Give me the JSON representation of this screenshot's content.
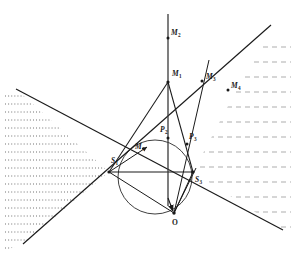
{
  "figure": {
    "width": 293,
    "height": 259,
    "background_color": "#ffffff",
    "stroke_color": "#1a1a1a",
    "hatch_color_left": "#3a3a3a",
    "hatch_color_right": "#7a7a7a"
  },
  "labels": {
    "m2": {
      "text": "M",
      "sub": "2",
      "x": 171,
      "y": 33
    },
    "m1": {
      "text": "M",
      "sub": "1",
      "x": 172,
      "y": 74
    },
    "m3": {
      "text": "M",
      "sub": "3",
      "x": 205,
      "y": 78
    },
    "m4_right": {
      "text": "M",
      "sub": "4",
      "x": 232,
      "y": 86
    },
    "m4_inner": {
      "text": "M",
      "sub": "4",
      "x": 136,
      "y": 148
    },
    "p2": {
      "text": "P",
      "sub": "2",
      "x": 160,
      "y": 130
    },
    "p3": {
      "text": "P",
      "sub": "3",
      "x": 189,
      "y": 138
    },
    "s1": {
      "text": "S",
      "sub": "1",
      "x": 112,
      "y": 152
    },
    "s3": {
      "text": "S",
      "sub": "3",
      "x": 196,
      "y": 174
    },
    "o": {
      "text": "O",
      "sub": "",
      "x": 174,
      "y": 220
    }
  },
  "geometry": {
    "circle": {
      "cx": 155,
      "cy": 177,
      "r": 37
    },
    "point_o": {
      "x": 174,
      "y": 213
    },
    "point_s1": {
      "x": 109,
      "y": 172
    },
    "point_s3": {
      "x": 193,
      "y": 172
    },
    "point_m1": {
      "x": 168,
      "y": 82
    },
    "point_p2": {
      "x": 168,
      "y": 137
    },
    "point_p3": {
      "x": 186,
      "y": 143
    },
    "chord_s1_s3": {
      "x1": 109,
      "y1": 172,
      "x2": 193,
      "y2": 172
    },
    "vertical_axis": {
      "x1": 168,
      "y1": 14,
      "x2": 168,
      "y2": 213
    },
    "ray_m2_tick": {
      "x": 168,
      "y": 38
    },
    "ray_m3_tick": {
      "x": 202,
      "y": 81
    },
    "ray_m4_tick": {
      "x": 228,
      "y": 90
    },
    "line_a": {
      "x1": 16,
      "y1": 89,
      "x2": 283,
      "y2": 230
    },
    "line_b": {
      "x1": 23,
      "y1": 244,
      "x2": 271,
      "y2": 25
    },
    "ray_o_to_m3": {
      "x1": 174,
      "y1": 213,
      "x2": 210,
      "y2": 58
    },
    "ray_o_to_m4": {
      "x1": 174,
      "y1": 213,
      "x2": 271,
      "y2": 25
    },
    "ray_o_to_m4_inner": {
      "x1": 109,
      "y1": 172,
      "x2": 148,
      "y2": 146
    },
    "triangle_left_edge": {
      "x1": 109,
      "y1": 172,
      "x2": 168,
      "y2": 82
    },
    "triangle_right_edge": {
      "x1": 168,
      "y1": 82,
      "x2": 193,
      "y2": 172
    },
    "ray_s1_to_o": {
      "x1": 109,
      "y1": 172,
      "x2": 174,
      "y2": 213
    },
    "ray_s3_to_o": {
      "x1": 193,
      "y1": 172,
      "x2": 174,
      "y2": 213
    }
  },
  "hatching": {
    "left_label": "dotted-wedge-left",
    "right_label": "dashed-region-right",
    "left_line_count": 19,
    "right_line_count": 12
  }
}
